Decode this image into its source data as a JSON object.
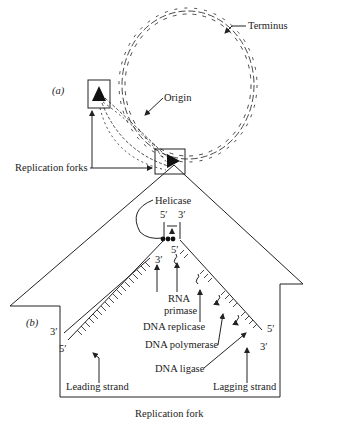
{
  "figure": {
    "panel_a": {
      "label": "(a)",
      "terminus_label": "Terminus",
      "origin_label": "Origin",
      "replication_forks_label": "Replication forks"
    },
    "panel_b": {
      "label": "(b)",
      "title": "Replication fork",
      "helicase_label": "Helicase",
      "parental_5prime": "5′",
      "parental_3prime": "3′",
      "leading": {
        "label": "Leading strand",
        "end_3prime": "3′",
        "end_5prime": "5′",
        "new_3prime": "3′"
      },
      "lagging": {
        "label": "Lagging strand",
        "end_5prime": "5′",
        "end_3prime": "3′",
        "primer_5prime": "5′"
      },
      "enzymes": {
        "rna_primase_line1": "RNA",
        "rna_primase_line2": "primase",
        "dna_replicase": "DNA replicase",
        "dna_polymerase": "DNA polymerase",
        "dna_ligase": "DNA ligase"
      }
    }
  }
}
